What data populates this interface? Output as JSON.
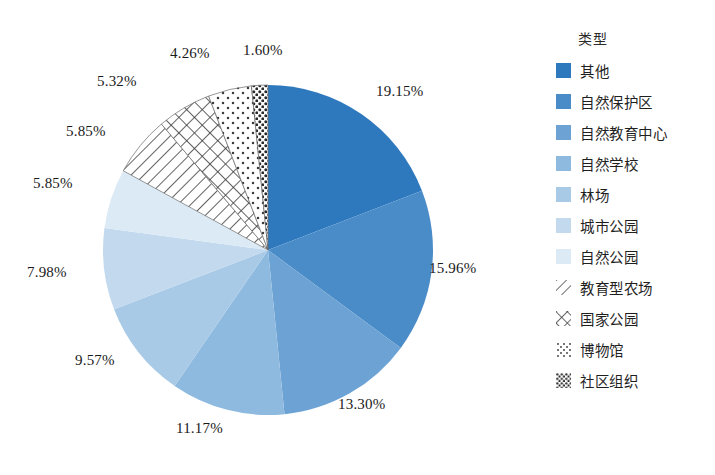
{
  "chart_data": {
    "type": "pie",
    "title": "",
    "legend_title": "类型",
    "legend_position": "right",
    "categories": [
      "其他",
      "自然保护区",
      "自然教育中心",
      "自然学校",
      "林场",
      "城市公园",
      "自然公园",
      "教育型农场",
      "国家公园",
      "博物馆",
      "社区组织"
    ],
    "values": [
      19.15,
      15.96,
      13.3,
      11.17,
      9.57,
      7.98,
      5.85,
      5.85,
      5.32,
      4.26,
      1.6
    ],
    "labels": [
      "19.15%",
      "15.96%",
      "13.30%",
      "11.17%",
      "9.57%",
      "7.98%",
      "5.85%",
      "5.85%",
      "5.32%",
      "4.26%",
      "1.60%"
    ],
    "unit": "%",
    "start_angle_deg": 0,
    "direction": "clockwise",
    "colors": [
      "#2E79BD",
      "#4A8CC8",
      "#6CA3D4",
      "#8FBADF",
      "#A9CAE6",
      "#C3DAEE",
      "#DCEAF5",
      "#FFFFFF",
      "#FFFFFF",
      "#FFFFFF",
      "#FFFFFF"
    ],
    "patterns": [
      "solid",
      "solid",
      "solid",
      "solid",
      "solid",
      "solid",
      "solid",
      "diagonal-lines",
      "crosshatch",
      "sparse-dots",
      "dense-dots"
    ],
    "center": {
      "x": 268,
      "y": 250
    },
    "radius": 165
  },
  "labels_layout": [
    {
      "text": "19.15%",
      "x": 376,
      "y": 83
    },
    {
      "text": "15.96%",
      "x": 429,
      "y": 260
    },
    {
      "text": "13.30%",
      "x": 338,
      "y": 396
    },
    {
      "text": "11.17%",
      "x": 176,
      "y": 420
    },
    {
      "text": "9.57%",
      "x": 75,
      "y": 352
    },
    {
      "text": "7.98%",
      "x": 27,
      "y": 264
    },
    {
      "text": "5.85%",
      "x": 33,
      "y": 175
    },
    {
      "text": "5.85%",
      "x": 66,
      "y": 123
    },
    {
      "text": "5.32%",
      "x": 97,
      "y": 73
    },
    {
      "text": "4.26%",
      "x": 170,
      "y": 45
    },
    {
      "text": "1.60%",
      "x": 243,
      "y": 42
    }
  ],
  "legend": {
    "title": "类型",
    "items": [
      {
        "label": "其他",
        "swatch": "solid",
        "color": "#2E79BD"
      },
      {
        "label": "自然保护区",
        "swatch": "solid",
        "color": "#4A8CC8"
      },
      {
        "label": "自然教育中心",
        "swatch": "solid",
        "color": "#6CA3D4"
      },
      {
        "label": "自然学校",
        "swatch": "solid",
        "color": "#8FBADF"
      },
      {
        "label": "林场",
        "swatch": "solid",
        "color": "#A9CAE6"
      },
      {
        "label": "城市公园",
        "swatch": "solid",
        "color": "#C3DAEE"
      },
      {
        "label": "自然公园",
        "swatch": "solid",
        "color": "#DCEAF5"
      },
      {
        "label": "教育型农场",
        "swatch": "diagonal-lines",
        "color": "#FFFFFF"
      },
      {
        "label": "国家公园",
        "swatch": "crosshatch",
        "color": "#FFFFFF"
      },
      {
        "label": "博物馆",
        "swatch": "sparse-dots",
        "color": "#FFFFFF"
      },
      {
        "label": "社区组织",
        "swatch": "dense-dots",
        "color": "#FFFFFF"
      }
    ]
  }
}
